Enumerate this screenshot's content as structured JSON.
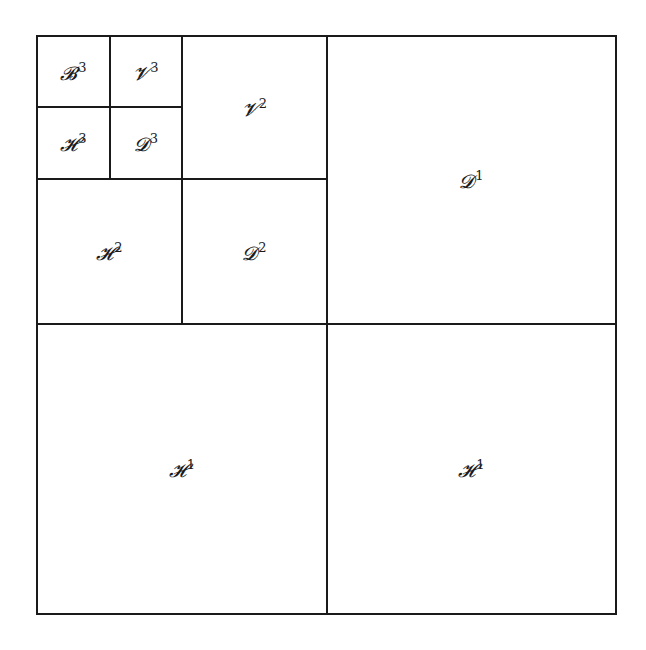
{
  "diagram": {
    "type": "wavelet-decomposition-subbands",
    "frame": {
      "x": 36,
      "y": 35,
      "width": 581,
      "height": 580
    },
    "line_color": "#1a1a1a",
    "background": "#ffffff",
    "cells": [
      {
        "id": "B3",
        "letter": "𝓑",
        "level": "3",
        "x": 36,
        "y": 35,
        "w": 75,
        "h": 73
      },
      {
        "id": "V3",
        "letter": "𝓥",
        "level": "3",
        "x": 109,
        "y": 35,
        "w": 74,
        "h": 73
      },
      {
        "id": "H3",
        "letter": "𝓗",
        "level": "3",
        "x": 36,
        "y": 106,
        "w": 75,
        "h": 74
      },
      {
        "id": "D3",
        "letter": "𝓓",
        "level": "3",
        "x": 109,
        "y": 106,
        "w": 74,
        "h": 74
      },
      {
        "id": "V2",
        "letter": "𝓥",
        "level": "2",
        "x": 181,
        "y": 35,
        "w": 147,
        "h": 145
      },
      {
        "id": "H2",
        "letter": "𝓗",
        "level": "2",
        "x": 36,
        "y": 178,
        "w": 147,
        "h": 147
      },
      {
        "id": "D2",
        "letter": "𝓓",
        "level": "2",
        "x": 181,
        "y": 178,
        "w": 147,
        "h": 147
      },
      {
        "id": "D1",
        "letter": "𝓓",
        "level": "1",
        "x": 326,
        "y": 35,
        "w": 291,
        "h": 290
      },
      {
        "id": "H1a",
        "letter": "𝓗",
        "level": "1",
        "x": 36,
        "y": 323,
        "w": 292,
        "h": 292
      },
      {
        "id": "H1b",
        "letter": "𝓗",
        "level": "1",
        "x": 326,
        "y": 323,
        "w": 291,
        "h": 292
      }
    ]
  }
}
